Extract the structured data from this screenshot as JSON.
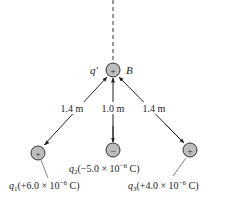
{
  "diagram": {
    "test_charge": {
      "symbol": "q′",
      "point_label": "B",
      "sign": "+"
    },
    "distances": [
      {
        "label": "1.4 m"
      },
      {
        "label": "1.0 m"
      },
      {
        "label": "1.4 m"
      }
    ],
    "charges": [
      {
        "name": "q",
        "sub": "1",
        "sign": "+",
        "value": "(+6.0 × 10",
        "exp": "−6",
        "unit": " C)"
      },
      {
        "name": "q",
        "sub": "2",
        "sign": "−",
        "value": "(−5.0 × 10",
        "exp": "−6",
        "unit": " C)"
      },
      {
        "name": "q",
        "sub": "3",
        "sign": "+",
        "value": "(+4.0 × 10",
        "exp": "−6",
        "unit": " C)"
      }
    ],
    "colors": {
      "charge_fill": "#bdbdbd",
      "stroke": "#333333"
    }
  }
}
